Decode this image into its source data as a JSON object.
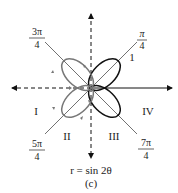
{
  "diagram": {
    "equation": "r = sin 2θ",
    "caption": "(c)",
    "angle_labels": {
      "pi_4": {
        "num": "π",
        "den": "4"
      },
      "three_pi_4": {
        "num": "3π",
        "den": "4"
      },
      "five_pi_4": {
        "num": "5π",
        "den": "4"
      },
      "seven_pi_4": {
        "num": "7π",
        "den": "4"
      }
    },
    "petal_labels": {
      "petal_1": "1",
      "region_I": "I",
      "region_II": "II",
      "region_III": "III",
      "region_IV": "IV"
    },
    "colors": {
      "black_petals": "#111111",
      "gray_petals": "#777777",
      "axis": "#111111"
    }
  }
}
